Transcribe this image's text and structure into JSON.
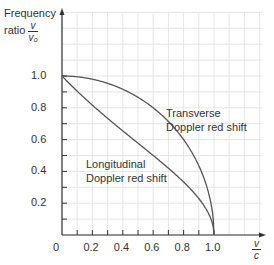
{
  "chart_data": {
    "type": "line",
    "title": "",
    "xlabel": "v/c",
    "ylabel": "Frequency ratio v/v0",
    "xlim": [
      0,
      1.0
    ],
    "ylim": [
      0,
      1.2
    ],
    "grid": true,
    "x_ticks": [
      "0",
      "0.2",
      "0.4",
      "0.6",
      "0.8",
      "1.0"
    ],
    "y_ticks": [
      "0.2",
      "0.4",
      "0.6",
      "0.8",
      "1.0"
    ],
    "series": [
      {
        "name": "Transverse Doppler red shift",
        "formula": "sqrt(1 - (v/c)^2)",
        "x": [
          0,
          0.1,
          0.2,
          0.3,
          0.4,
          0.5,
          0.6,
          0.7,
          0.8,
          0.9,
          0.95,
          1.0
        ],
        "y": [
          1.0,
          0.995,
          0.98,
          0.954,
          0.917,
          0.866,
          0.8,
          0.714,
          0.6,
          0.436,
          0.312,
          0.0
        ]
      },
      {
        "name": "Longitudinal Doppler red shift",
        "formula": "sqrt((1 - v/c)/(1 + v/c))",
        "x": [
          0,
          0.1,
          0.2,
          0.3,
          0.4,
          0.5,
          0.6,
          0.7,
          0.8,
          0.9,
          0.95,
          1.0
        ],
        "y": [
          1.0,
          0.905,
          0.816,
          0.734,
          0.655,
          0.577,
          0.5,
          0.42,
          0.333,
          0.229,
          0.16,
          0.0
        ]
      }
    ],
    "annotations": [
      {
        "text": "Transverse\nDoppler red shift",
        "x": 0.69,
        "y": 0.92
      },
      {
        "text": "Longitudinal\nDoppler red shift",
        "x": 0.28,
        "y": 0.42
      }
    ]
  },
  "labels": {
    "y_axis_prefix": "Frequency",
    "y_axis_ratio": "ratio",
    "y_frac_num": "v",
    "y_frac_den": "v₀",
    "x_frac_num": "v",
    "x_frac_den": "c",
    "transverse_line1": "Transverse",
    "transverse_line2": "Doppler red shift",
    "longitudinal_line1": "Longitudinal",
    "longitudinal_line2": "Doppler red shift",
    "x_ticks": [
      "0",
      "0.2",
      "0.4",
      "0.6",
      "0.8",
      "1.0"
    ],
    "y_ticks": [
      "1.0",
      "0.8",
      "0.6",
      "0.4",
      "0.2"
    ]
  }
}
